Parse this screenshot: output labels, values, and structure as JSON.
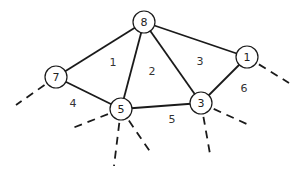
{
  "diagram": {
    "type": "planar-graph",
    "nodes": [
      {
        "id": "n8",
        "label": "8",
        "x": 144,
        "y": 22
      },
      {
        "id": "n7",
        "label": "7",
        "x": 56,
        "y": 77
      },
      {
        "id": "n5",
        "label": "5",
        "x": 121,
        "y": 109
      },
      {
        "id": "n3",
        "label": "3",
        "x": 201,
        "y": 103
      },
      {
        "id": "n1",
        "label": "1",
        "x": 247,
        "y": 57
      }
    ],
    "edges": [
      {
        "from": "n8",
        "to": "n7"
      },
      {
        "from": "n8",
        "to": "n5"
      },
      {
        "from": "n8",
        "to": "n3"
      },
      {
        "from": "n8",
        "to": "n1"
      },
      {
        "from": "n7",
        "to": "n5"
      },
      {
        "from": "n5",
        "to": "n3"
      },
      {
        "from": "n3",
        "to": "n1"
      }
    ],
    "dangling_edges": [
      {
        "from": "n7",
        "x2": 16,
        "y2": 105
      },
      {
        "from": "n1",
        "x2": 289,
        "y2": 83
      },
      {
        "from": "n5",
        "x2": 70,
        "y2": 129
      },
      {
        "from": "n5",
        "x2": 114,
        "y2": 166
      },
      {
        "from": "n5",
        "x2": 151,
        "y2": 153
      },
      {
        "from": "n3",
        "x2": 251,
        "y2": 126
      },
      {
        "from": "n3",
        "x2": 210,
        "y2": 154
      }
    ],
    "faces": [
      {
        "label": "1",
        "x": 113,
        "y": 62
      },
      {
        "label": "2",
        "x": 152,
        "y": 71
      },
      {
        "label": "3",
        "x": 200,
        "y": 61
      },
      {
        "label": "4",
        "x": 73,
        "y": 103
      },
      {
        "label": "5",
        "x": 172,
        "y": 119
      },
      {
        "label": "6",
        "x": 244,
        "y": 88
      }
    ],
    "node_radius": 11,
    "colors": {
      "stroke": "#1a1a1a",
      "fill": "#ffffff"
    }
  }
}
